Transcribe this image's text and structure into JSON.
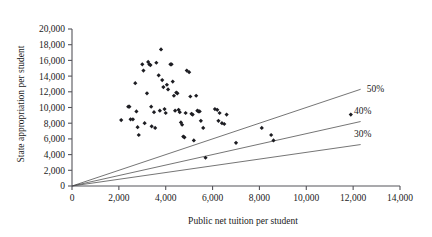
{
  "chart_data": {
    "type": "scatter",
    "title": "",
    "xlabel": "Public net tuition per student",
    "ylabel": "State appropriation per student",
    "xlim": [
      0,
      14000
    ],
    "ylim": [
      0,
      20000
    ],
    "xticks": [
      0,
      2000,
      4000,
      6000,
      8000,
      10000,
      12000,
      14000
    ],
    "xtick_labels": [
      "0",
      "2,000",
      "4,000",
      "6,000",
      "8,000",
      "10,000",
      "12,000",
      "14,000"
    ],
    "yticks": [
      0,
      2000,
      4000,
      6000,
      8000,
      10000,
      12000,
      14000,
      16000,
      18000,
      20000
    ],
    "ytick_labels": [
      "0",
      "2,000",
      "4,000",
      "6,000",
      "8,000",
      "10,000",
      "12,000",
      "14,000",
      "16,000",
      "18,000",
      "20,000"
    ],
    "grid": false,
    "legend": "none",
    "marker": "diamond",
    "marker_color": "#1d1d22",
    "reference_lines": [
      {
        "label": "30%",
        "ratio_of_total": 0.3,
        "slope": 0.4286,
        "x_end": 14000,
        "line_color": "#3a3a3a"
      },
      {
        "label": "40%",
        "ratio_of_total": 0.4,
        "slope": 0.6667,
        "x_end": 14000,
        "line_color": "#3a3a3a"
      },
      {
        "label": "50%",
        "ratio_of_total": 0.5,
        "slope": 1.0,
        "x_end": 14000,
        "line_color": "#3a3a3a"
      }
    ],
    "points": [
      {
        "x": 2100,
        "y": 8400
      },
      {
        "x": 2400,
        "y": 10100
      },
      {
        "x": 2450,
        "y": 10100
      },
      {
        "x": 2500,
        "y": 8500
      },
      {
        "x": 2600,
        "y": 8500
      },
      {
        "x": 2700,
        "y": 13100
      },
      {
        "x": 2750,
        "y": 9500
      },
      {
        "x": 2800,
        "y": 7500
      },
      {
        "x": 2850,
        "y": 6500
      },
      {
        "x": 3000,
        "y": 15500
      },
      {
        "x": 3050,
        "y": 14700
      },
      {
        "x": 3100,
        "y": 8000
      },
      {
        "x": 3200,
        "y": 11800
      },
      {
        "x": 3250,
        "y": 15800
      },
      {
        "x": 3300,
        "y": 15500
      },
      {
        "x": 3350,
        "y": 15400
      },
      {
        "x": 3380,
        "y": 10100
      },
      {
        "x": 3400,
        "y": 7600
      },
      {
        "x": 3500,
        "y": 9400
      },
      {
        "x": 3550,
        "y": 7400
      },
      {
        "x": 3600,
        "y": 15700
      },
      {
        "x": 3700,
        "y": 14100
      },
      {
        "x": 3750,
        "y": 9600
      },
      {
        "x": 3800,
        "y": 17400
      },
      {
        "x": 3850,
        "y": 13500
      },
      {
        "x": 3900,
        "y": 12600
      },
      {
        "x": 3950,
        "y": 9800
      },
      {
        "x": 4000,
        "y": 9300
      },
      {
        "x": 4050,
        "y": 12900
      },
      {
        "x": 4100,
        "y": 12300
      },
      {
        "x": 4200,
        "y": 15500
      },
      {
        "x": 4250,
        "y": 15500
      },
      {
        "x": 4300,
        "y": 13300
      },
      {
        "x": 4350,
        "y": 11500
      },
      {
        "x": 4400,
        "y": 9600
      },
      {
        "x": 4450,
        "y": 11900
      },
      {
        "x": 4500,
        "y": 11800
      },
      {
        "x": 4550,
        "y": 9700
      },
      {
        "x": 4600,
        "y": 9400
      },
      {
        "x": 4650,
        "y": 8100
      },
      {
        "x": 4700,
        "y": 7800
      },
      {
        "x": 4750,
        "y": 6300
      },
      {
        "x": 4800,
        "y": 6200
      },
      {
        "x": 4850,
        "y": 9300
      },
      {
        "x": 4900,
        "y": 14700
      },
      {
        "x": 5000,
        "y": 14500
      },
      {
        "x": 5050,
        "y": 11400
      },
      {
        "x": 5100,
        "y": 9200
      },
      {
        "x": 5150,
        "y": 9100
      },
      {
        "x": 5200,
        "y": 5800
      },
      {
        "x": 5300,
        "y": 11500
      },
      {
        "x": 5350,
        "y": 9600
      },
      {
        "x": 5400,
        "y": 9500
      },
      {
        "x": 5450,
        "y": 9500
      },
      {
        "x": 5500,
        "y": 8300
      },
      {
        "x": 5600,
        "y": 7400
      },
      {
        "x": 5700,
        "y": 3600
      },
      {
        "x": 6100,
        "y": 9800
      },
      {
        "x": 6200,
        "y": 9700
      },
      {
        "x": 6250,
        "y": 8300
      },
      {
        "x": 6300,
        "y": 9300
      },
      {
        "x": 6400,
        "y": 8000
      },
      {
        "x": 6500,
        "y": 7900
      },
      {
        "x": 6600,
        "y": 9100
      },
      {
        "x": 7000,
        "y": 5500
      },
      {
        "x": 8100,
        "y": 7400
      },
      {
        "x": 8500,
        "y": 6500
      },
      {
        "x": 8600,
        "y": 5800
      },
      {
        "x": 11900,
        "y": 9100
      }
    ]
  }
}
